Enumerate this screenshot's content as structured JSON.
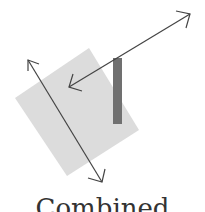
{
  "diagram": {
    "square": {
      "points": "89,48 139,130 67,176 15,98",
      "fill": "#dcdcdc"
    },
    "bar": {
      "x": 113,
      "y": 58,
      "width": 9,
      "height": 66,
      "fill": "#707070"
    },
    "arrow_diagonal_long": {
      "x1": 28,
      "y1": 60,
      "x2": 102,
      "y2": 182,
      "color": "#444444"
    },
    "arrow_diagonal_short": {
      "x1": 69,
      "y1": 87,
      "x2": 190,
      "y2": 14,
      "color": "#444444"
    }
  },
  "caption": "Combined"
}
